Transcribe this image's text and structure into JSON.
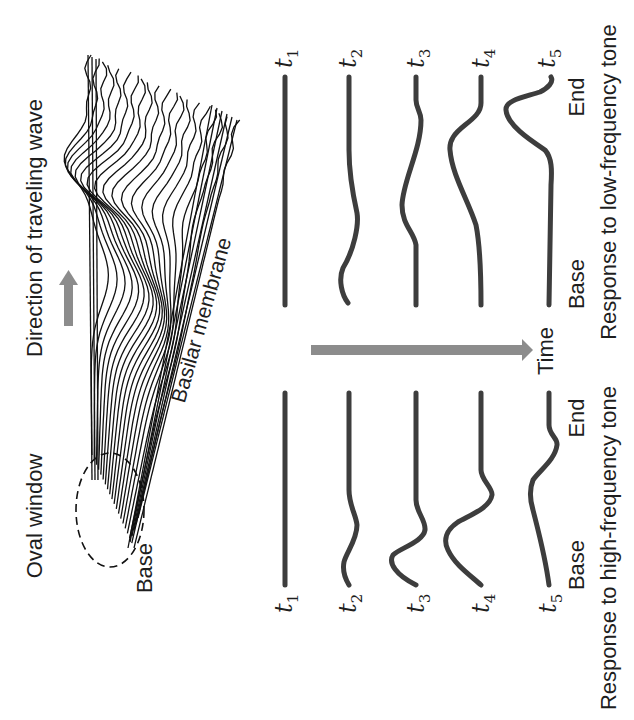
{
  "figure": {
    "orientation": "rotated-90-ccw",
    "colors": {
      "trace": "#3d3d3d",
      "arrow": "#8c8c8c",
      "text": "#1e1e1e",
      "background": "#ffffff"
    },
    "top_diagram": {
      "oval_window_label": "Oval window",
      "base_label": "Base",
      "direction_label": "Direction of traveling wave",
      "membrane_label": "Basilar membrane",
      "direction_arrow_icon": "up-arrow-icon"
    },
    "time_axis": {
      "label": "Time",
      "arrow_icon": "right-arrow-icon"
    },
    "low_frequency": {
      "caption": "Response to low-frequency tone",
      "base_label": "Base",
      "end_label": "End",
      "traces": [
        {
          "label": "t",
          "sub": "1"
        },
        {
          "label": "t",
          "sub": "2"
        },
        {
          "label": "t",
          "sub": "3"
        },
        {
          "label": "t",
          "sub": "4"
        },
        {
          "label": "t",
          "sub": "5"
        }
      ]
    },
    "high_frequency": {
      "caption": "Response to high-frequency tone",
      "base_label": "Base",
      "end_label": "End",
      "traces": [
        {
          "label": "t",
          "sub": "1"
        },
        {
          "label": "t",
          "sub": "2"
        },
        {
          "label": "t",
          "sub": "3"
        },
        {
          "label": "t",
          "sub": "4"
        },
        {
          "label": "t",
          "sub": "5"
        }
      ]
    }
  }
}
